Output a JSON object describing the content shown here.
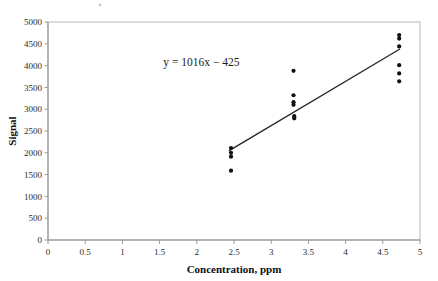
{
  "chart_data": {
    "type": "scatter",
    "title": "",
    "xlabel": "Concentration, ppm",
    "ylabel": "Signal",
    "xlim": [
      0,
      5
    ],
    "ylim": [
      0,
      5000
    ],
    "xticks": [
      0,
      0.5,
      1,
      1.5,
      2,
      2.5,
      3,
      3.5,
      4,
      4.5,
      5
    ],
    "xtick_labels": [
      "0",
      "0.5",
      "1",
      "1.5",
      "2",
      "2.5",
      "3",
      "3.5",
      "4",
      "4.5",
      "5"
    ],
    "yticks": [
      0,
      500,
      1000,
      1500,
      2000,
      2500,
      3000,
      3500,
      4000,
      4500,
      5000
    ],
    "ytick_labels": [
      "0",
      "500",
      "1000",
      "1500",
      "2000",
      "2500",
      "3000",
      "3500",
      "4000",
      "4500",
      "5000"
    ],
    "grid": false,
    "legend": false,
    "annotations": [
      {
        "name": "regression-equation",
        "text": "y = 1016x − 425",
        "x": 1.55,
        "y": 4000
      }
    ],
    "series": [
      {
        "name": "calibration-points",
        "marker": "circle",
        "color": "#111111",
        "points": [
          {
            "x": 2.46,
            "y": 2110
          },
          {
            "x": 2.46,
            "y": 2000
          },
          {
            "x": 2.46,
            "y": 1910
          },
          {
            "x": 2.46,
            "y": 1590
          },
          {
            "x": 3.3,
            "y": 3880
          },
          {
            "x": 3.3,
            "y": 3320
          },
          {
            "x": 3.3,
            "y": 3160
          },
          {
            "x": 3.3,
            "y": 3100
          },
          {
            "x": 3.31,
            "y": 2840
          },
          {
            "x": 3.31,
            "y": 2790
          },
          {
            "x": 4.72,
            "y": 4700
          },
          {
            "x": 4.72,
            "y": 4620
          },
          {
            "x": 4.72,
            "y": 4440
          },
          {
            "x": 4.72,
            "y": 4010
          },
          {
            "x": 4.72,
            "y": 3820
          },
          {
            "x": 4.72,
            "y": 3640
          }
        ]
      }
    ],
    "fit_line": {
      "name": "regression-line",
      "equation": "y = 1016x − 425",
      "slope": 1016,
      "intercept": -425,
      "x_start": 2.43,
      "x_end": 4.73,
      "color": "#232323"
    }
  },
  "colors": {
    "marker": "#111111",
    "line": "#232323",
    "axis": "#8d8d8d",
    "border": "#b9b9b9",
    "text": "#1a1a1a",
    "background": "#ffffff"
  }
}
